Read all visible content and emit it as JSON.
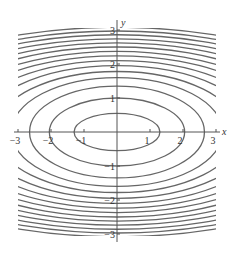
{
  "chart_data": {
    "type": "contour",
    "title": "",
    "xlabel": "x",
    "ylabel": "y",
    "xlim": [
      -3,
      3
    ],
    "ylim": [
      -3,
      3
    ],
    "x_ticks": [
      -3,
      -2,
      -1,
      1,
      2,
      3
    ],
    "y_ticks": [
      -3,
      -2,
      -1,
      1,
      2,
      3
    ],
    "x_tick_labels": [
      "−3",
      "−2",
      "−1",
      "1",
      "2",
      "3"
    ],
    "y_tick_labels": [
      "−3",
      "−2",
      "−1",
      "1",
      "2",
      "3"
    ],
    "grid": false,
    "contours": [
      {
        "a": 1.3,
        "b": 0.55
      },
      {
        "a": 2.05,
        "b": 1.0
      },
      {
        "a": 2.65,
        "b": 1.35
      },
      {
        "a": 3.2,
        "b": 1.6
      },
      {
        "a": 3.7,
        "b": 1.78
      },
      {
        "a": 4.2,
        "b": 1.95
      },
      {
        "a": 4.65,
        "b": 2.1
      },
      {
        "a": 5.1,
        "b": 2.24
      },
      {
        "a": 5.5,
        "b": 2.37
      },
      {
        "a": 5.9,
        "b": 2.5
      },
      {
        "a": 6.3,
        "b": 2.62
      },
      {
        "a": 6.7,
        "b": 2.74
      },
      {
        "a": 7.1,
        "b": 2.86
      },
      {
        "a": 7.5,
        "b": 2.97
      },
      {
        "a": 7.9,
        "b": 3.08
      }
    ]
  },
  "plot": {
    "origin_px": [
      117,
      132
    ],
    "x_scale_px": 33,
    "y_scale_px": 34,
    "box_px": [
      18,
      28,
      216,
      236
    ],
    "line_color": "#666666",
    "axis_color": "#555555"
  }
}
